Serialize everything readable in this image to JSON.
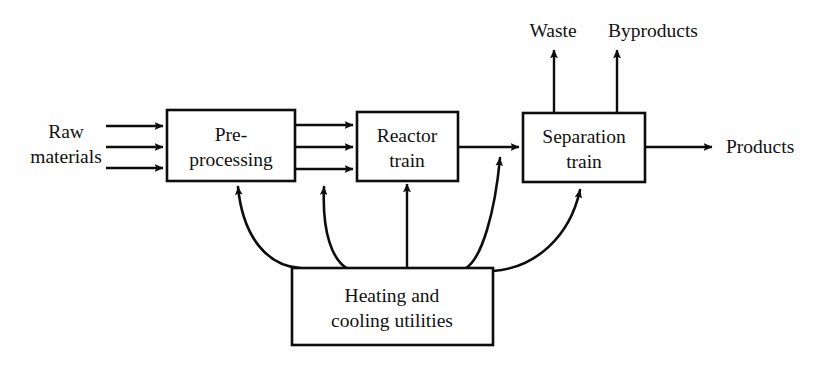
{
  "diagram": {
    "background_color": "#ffffff",
    "line_color": "#0d0d0d",
    "text_color": "#111111",
    "boxes": [
      {
        "id": "pre-processing",
        "label_line1": "Pre-",
        "label_line2": "processing",
        "x": 167,
        "y": 110,
        "width": 128,
        "height": 71
      },
      {
        "id": "reactor-train",
        "label_line1": "Reactor",
        "label_line2": "train",
        "x": 357,
        "y": 112,
        "width": 101,
        "height": 69
      },
      {
        "id": "separation-train",
        "label_line1": "Separation",
        "label_line2": "train",
        "x": 523,
        "y": 113,
        "width": 122,
        "height": 69
      },
      {
        "id": "heating-cooling-utilities",
        "label_line1": "Heating and",
        "label_line2": "cooling utilities",
        "x": 292,
        "y": 268,
        "width": 201,
        "height": 77
      }
    ],
    "stream_labels": [
      {
        "id": "raw-materials",
        "line1": "Raw",
        "line2": "materials",
        "x": 66,
        "y1": 138,
        "y2": 163
      },
      {
        "id": "waste",
        "text": "Waste",
        "x": 553,
        "y": 37
      },
      {
        "id": "byproducts",
        "text": "Byproducts",
        "x": 653,
        "y": 37
      },
      {
        "id": "products",
        "text": "Products",
        "x": 726,
        "y": 153
      }
    ],
    "streams": [
      {
        "id": "raw-materials-stream-1",
        "from": "raw-materials",
        "to": "pre-processing",
        "kind": "straight-horizontal"
      },
      {
        "id": "raw-materials-stream-2",
        "from": "raw-materials",
        "to": "pre-processing",
        "kind": "straight-horizontal"
      },
      {
        "id": "raw-materials-stream-3",
        "from": "raw-materials",
        "to": "pre-processing",
        "kind": "straight-horizontal"
      },
      {
        "id": "preprocessing-to-reactor-1",
        "from": "pre-processing",
        "to": "reactor-train",
        "kind": "straight-horizontal"
      },
      {
        "id": "preprocessing-to-reactor-2",
        "from": "pre-processing",
        "to": "reactor-train",
        "kind": "straight-horizontal"
      },
      {
        "id": "preprocessing-to-reactor-3",
        "from": "pre-processing",
        "to": "reactor-train",
        "kind": "straight-horizontal"
      },
      {
        "id": "reactor-to-separation",
        "from": "reactor-train",
        "to": "separation-train",
        "kind": "straight-horizontal"
      },
      {
        "id": "separation-to-products",
        "from": "separation-train",
        "to": "products",
        "kind": "straight-horizontal"
      },
      {
        "id": "separation-to-waste",
        "from": "separation-train",
        "to": "waste",
        "kind": "straight-vertical"
      },
      {
        "id": "separation-to-byproducts",
        "from": "separation-train",
        "to": "byproducts",
        "kind": "straight-vertical"
      },
      {
        "id": "utilities-to-preprocessing-a",
        "from": "heating-cooling-utilities",
        "to": "pre-processing",
        "kind": "curved"
      },
      {
        "id": "utilities-to-preprocessing-b",
        "from": "heating-cooling-utilities",
        "to": "pre-processing",
        "kind": "curved"
      },
      {
        "id": "utilities-to-reactor",
        "from": "heating-cooling-utilities",
        "to": "reactor-train",
        "kind": "straight-vertical"
      },
      {
        "id": "utilities-to-reactor-outlet",
        "from": "heating-cooling-utilities",
        "to": "reactor-to-separation",
        "kind": "curved"
      },
      {
        "id": "utilities-to-separation",
        "from": "heating-cooling-utilities",
        "to": "separation-train",
        "kind": "curved"
      }
    ]
  }
}
